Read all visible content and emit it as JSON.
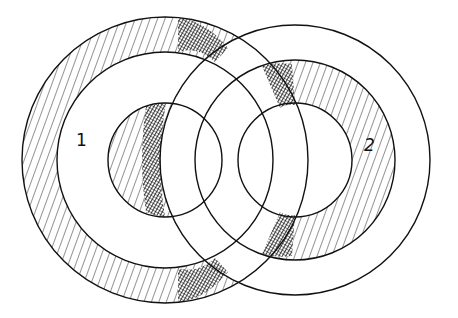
{
  "diagram": {
    "colors": {
      "ink": "#111111",
      "background": "#ffffff"
    },
    "systems": [
      {
        "id": "1",
        "label": "1",
        "center": [
          165,
          160
        ],
        "radii": {
          "outer": 143,
          "middle": 108,
          "inner": 57
        },
        "label_pos": [
          76,
          132
        ]
      },
      {
        "id": "2",
        "label": "2",
        "center": [
          295,
          160
        ],
        "radii": {
          "outer": 135,
          "middle": 100,
          "inner": 57
        },
        "label_pos": [
          364,
          137
        ]
      }
    ]
  }
}
